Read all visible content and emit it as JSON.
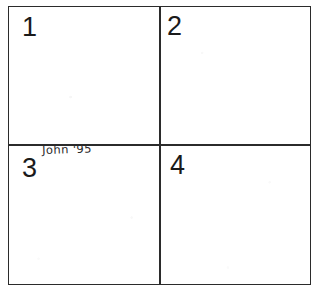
{
  "document": {
    "type": "hand-drawn four-panel grid",
    "background_color": "#ffffff",
    "ink_color": "#2b2b2b"
  },
  "grid": {
    "rows": 2,
    "columns": 2,
    "panels": [
      {
        "number": "1",
        "position": "top-left",
        "content": ""
      },
      {
        "number": "2",
        "position": "top-right",
        "content": ""
      },
      {
        "number": "3",
        "position": "bottom-left",
        "content": ""
      },
      {
        "number": "4",
        "position": "bottom-right",
        "content": ""
      }
    ]
  },
  "annotations": {
    "signature": "John '95"
  }
}
